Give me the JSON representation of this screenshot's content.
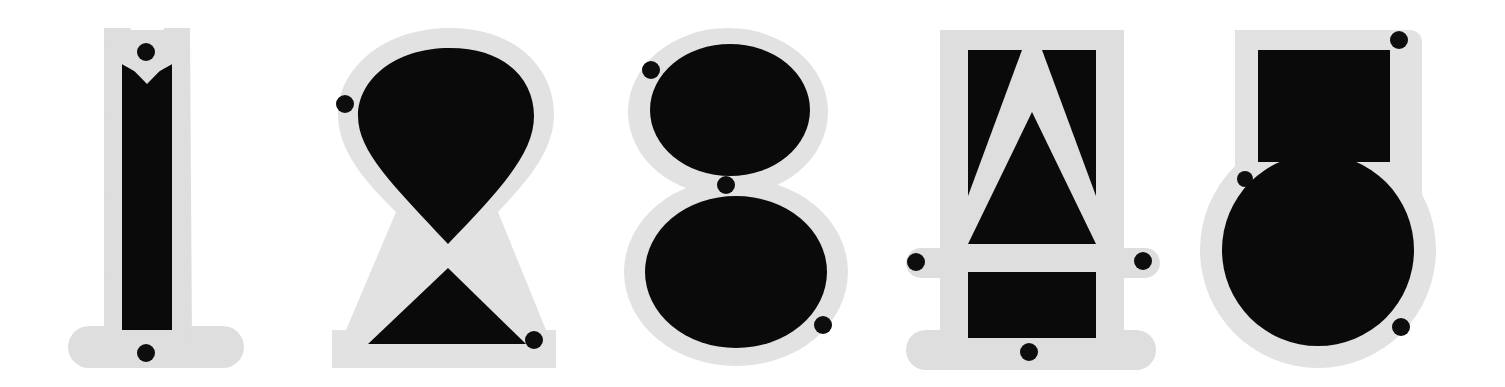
{
  "artwork": {
    "title": "Stylized numeral plates",
    "width": 1505,
    "height": 387,
    "background_color": "#ffffff",
    "plate_color": "#dedede",
    "ink_color": "#0a0a0a",
    "rivet_color": "#0d0d0d",
    "description": "Five digit-like glyphs rendered as black forms mounted on light gray plates with small black rivet dots"
  },
  "glyphs": [
    {
      "id": "glyph-1",
      "character": "1",
      "name": "numeral-one",
      "x": 60,
      "width": 180,
      "rivet_count": 2,
      "rivets": [
        {
          "name": "rivet-top",
          "cx": 146,
          "cy": 52,
          "r": 9
        },
        {
          "name": "rivet-bottom",
          "cx": 146,
          "cy": 353,
          "r": 9
        }
      ]
    },
    {
      "id": "glyph-2",
      "character": "2",
      "name": "numeral-two",
      "x": 330,
      "width": 230,
      "rivet_count": 2,
      "rivets": [
        {
          "name": "rivet-upper-left",
          "cx": 345,
          "cy": 104,
          "r": 9
        },
        {
          "name": "rivet-lower-right",
          "cx": 534,
          "cy": 340,
          "r": 9
        }
      ]
    },
    {
      "id": "glyph-3",
      "character": "8",
      "name": "numeral-eight",
      "x": 624,
      "width": 228,
      "rivet_count": 3,
      "rivets": [
        {
          "name": "rivet-upper-left",
          "cx": 651,
          "cy": 70,
          "r": 9
        },
        {
          "name": "rivet-waist",
          "cx": 726,
          "cy": 185,
          "r": 9
        },
        {
          "name": "rivet-lower-right",
          "cx": 823,
          "cy": 325,
          "r": 9
        }
      ]
    },
    {
      "id": "glyph-4",
      "character": "4",
      "name": "numeral-four",
      "x": 905,
      "width": 265,
      "rivet_count": 3,
      "rivets": [
        {
          "name": "rivet-left-tab",
          "cx": 916,
          "cy": 262,
          "r": 9
        },
        {
          "name": "rivet-right-tab",
          "cx": 1143,
          "cy": 261,
          "r": 9
        },
        {
          "name": "rivet-bottom",
          "cx": 1029,
          "cy": 352,
          "r": 9
        }
      ]
    },
    {
      "id": "glyph-5",
      "character": "5",
      "name": "numeral-five",
      "x": 1210,
      "width": 235,
      "rivet_count": 3,
      "rivets": [
        {
          "name": "rivet-top-right",
          "cx": 1399,
          "cy": 40,
          "r": 9
        },
        {
          "name": "rivet-mid-left",
          "cx": 1245,
          "cy": 179,
          "r": 8
        },
        {
          "name": "rivet-lower-right",
          "cx": 1401,
          "cy": 327,
          "r": 9
        }
      ]
    }
  ],
  "sequence_text": "1 2 8 4 5"
}
